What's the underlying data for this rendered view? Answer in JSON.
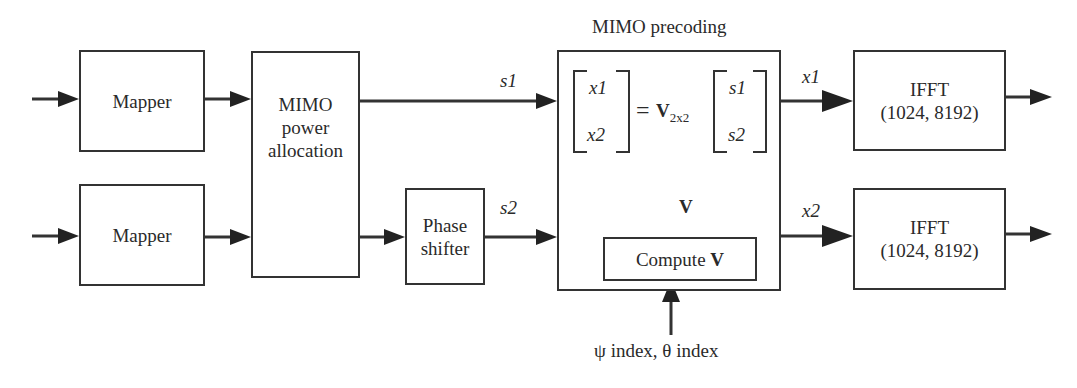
{
  "diagram": {
    "title": "MIMO precoding",
    "blocks": {
      "mapper_1": {
        "label": "Mapper"
      },
      "mapper_2": {
        "label": "Mapper"
      },
      "power_allocation": {
        "lines": [
          "MIMO",
          "power",
          "allocation"
        ]
      },
      "phase_shifter": {
        "lines": [
          "Phase",
          "shifter"
        ]
      },
      "precoding": {
        "title": "MIMO precoding",
        "lhs": [
          "x1",
          "x2"
        ],
        "equals": "=",
        "matrix": "V",
        "matrix_subscript": "2x2",
        "rhs": [
          "s1",
          "s2"
        ],
        "compute_label": "Compute ",
        "compute_bold": "V",
        "v_arrow_label": "V"
      },
      "ifft_1": {
        "lines": [
          "IFFT",
          "(1024, 8192)"
        ]
      },
      "ifft_2": {
        "lines": [
          "IFFT",
          "(1024, 8192)"
        ]
      }
    },
    "signals": {
      "s1": "s1",
      "s2": "s2",
      "x1": "x1",
      "x2": "x2",
      "control_input": "ψ index, θ index"
    },
    "colors": {
      "stroke": "#333333",
      "text": "#2a2a2a",
      "background": "#ffffff"
    }
  }
}
